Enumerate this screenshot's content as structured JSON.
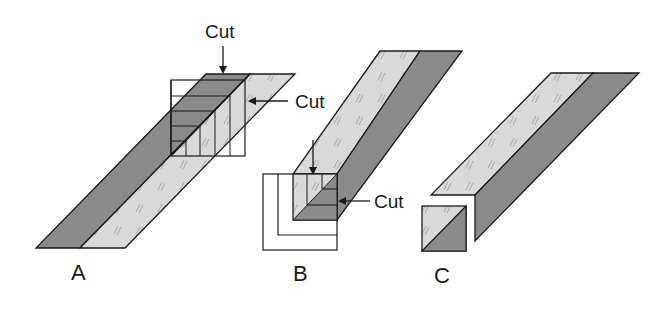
{
  "diagram": {
    "colors": {
      "dark_fabric": "#8a8a8a",
      "light_fabric": "#d9d9d9",
      "outline": "#1a1a1a",
      "background": "#ffffff"
    },
    "panels": [
      {
        "id": "A",
        "label": "A",
        "cut_labels": [
          "Cut",
          "Cut"
        ]
      },
      {
        "id": "B",
        "label": "B",
        "cut_labels": [
          "Cut",
          "Cut"
        ]
      },
      {
        "id": "C",
        "label": "C"
      }
    ]
  }
}
